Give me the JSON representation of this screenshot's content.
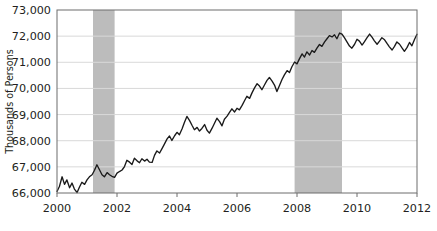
{
  "chart_data": {
    "type": "line",
    "title": "",
    "subtitle": "",
    "xlabel": "",
    "ylabel": "Thousands of Persons",
    "xlim": [
      2000.0,
      2012.0
    ],
    "ylim": [
      66000,
      73000
    ],
    "grid": "horizontal",
    "legend": "none",
    "x_ticks": [
      2000,
      2002,
      2004,
      2006,
      2008,
      2010,
      2012
    ],
    "x_tick_labels": [
      "2000",
      "2002",
      "2004",
      "2006",
      "2008",
      "2010",
      "2012"
    ],
    "y_ticks": [
      66000,
      67000,
      68000,
      69000,
      70000,
      71000,
      72000,
      73000
    ],
    "y_tick_labels": [
      "66,000",
      "67,000",
      "68,000",
      "69,000",
      "70,000",
      "71,000",
      "72,000",
      "73,000"
    ],
    "line_color": "#1a1a1a",
    "shaded_band_color": "#bcbcbc",
    "frame_color": "#6d6d6d",
    "gridline_color": "#d9d9d9",
    "annotations": [
      {
        "name": "recession-band-2001",
        "type": "vspan",
        "x_start": 2001.2,
        "x_end": 2001.92
      },
      {
        "name": "recession-band-2008",
        "type": "vspan",
        "x_start": 2007.92,
        "x_end": 2009.5
      }
    ],
    "series": [
      {
        "name": "Employment",
        "x": [
          2000.0,
          2000.08,
          2000.17,
          2000.25,
          2000.33,
          2000.42,
          2000.5,
          2000.58,
          2000.67,
          2000.75,
          2000.83,
          2000.92,
          2001.0,
          2001.08,
          2001.17,
          2001.25,
          2001.33,
          2001.42,
          2001.5,
          2001.58,
          2001.67,
          2001.75,
          2001.83,
          2001.92,
          2002.0,
          2002.08,
          2002.17,
          2002.25,
          2002.33,
          2002.42,
          2002.5,
          2002.58,
          2002.67,
          2002.75,
          2002.83,
          2002.92,
          2003.0,
          2003.08,
          2003.17,
          2003.25,
          2003.33,
          2003.42,
          2003.5,
          2003.58,
          2003.67,
          2003.75,
          2003.83,
          2003.92,
          2004.0,
          2004.08,
          2004.17,
          2004.25,
          2004.33,
          2004.42,
          2004.5,
          2004.58,
          2004.67,
          2004.75,
          2004.83,
          2004.92,
          2005.0,
          2005.08,
          2005.17,
          2005.25,
          2005.33,
          2005.42,
          2005.5,
          2005.58,
          2005.67,
          2005.75,
          2005.83,
          2005.92,
          2006.0,
          2006.08,
          2006.17,
          2006.25,
          2006.33,
          2006.42,
          2006.5,
          2006.58,
          2006.67,
          2006.75,
          2006.83,
          2006.92,
          2007.0,
          2007.08,
          2007.17,
          2007.25,
          2007.33,
          2007.42,
          2007.5,
          2007.58,
          2007.67,
          2007.75,
          2007.83,
          2007.92,
          2008.0,
          2008.08,
          2008.17,
          2008.25,
          2008.33,
          2008.42,
          2008.5,
          2008.58,
          2008.67,
          2008.75,
          2008.83,
          2008.92,
          2009.0,
          2009.08,
          2009.17,
          2009.25,
          2009.33,
          2009.42,
          2009.5,
          2009.58,
          2009.67,
          2009.75,
          2009.83,
          2009.92,
          2010.0,
          2010.08,
          2010.17,
          2010.25,
          2010.33,
          2010.42,
          2010.5,
          2010.58,
          2010.67,
          2010.75,
          2010.83,
          2010.92,
          2011.0,
          2011.08,
          2011.17,
          2011.25,
          2011.33,
          2011.42,
          2011.5,
          2011.58,
          2011.67,
          2011.75,
          2011.83,
          2011.92,
          2012.0
        ],
        "values": [
          66060,
          66250,
          66620,
          66330,
          66500,
          66200,
          66380,
          66150,
          66020,
          66230,
          66410,
          66330,
          66500,
          66620,
          66700,
          66870,
          67080,
          66880,
          66700,
          66620,
          66780,
          66700,
          66640,
          66600,
          66760,
          66820,
          66880,
          67010,
          67250,
          67180,
          67090,
          67330,
          67230,
          67160,
          67310,
          67220,
          67290,
          67180,
          67170,
          67440,
          67610,
          67530,
          67700,
          67870,
          68070,
          68180,
          68010,
          68190,
          68320,
          68230,
          68460,
          68710,
          68930,
          68770,
          68590,
          68420,
          68510,
          68370,
          68470,
          68620,
          68400,
          68290,
          68480,
          68670,
          68860,
          68730,
          68570,
          68820,
          68940,
          69080,
          69220,
          69100,
          69240,
          69180,
          69350,
          69530,
          69700,
          69620,
          69830,
          70010,
          70180,
          70090,
          69950,
          70140,
          70310,
          70420,
          70280,
          70130,
          69880,
          70120,
          70340,
          70520,
          70680,
          70610,
          70830,
          71010,
          70940,
          71130,
          71320,
          71200,
          71400,
          71280,
          71450,
          71380,
          71550,
          71680,
          71610,
          71780,
          71900,
          72020,
          71970,
          72050,
          71900,
          72120,
          72080,
          71940,
          71770,
          71620,
          71540,
          71690,
          71880,
          71810,
          71660,
          71790,
          71930,
          72080,
          71960,
          71820,
          71690,
          71810,
          71940,
          71860,
          71720,
          71590,
          71470,
          71610,
          71780,
          71690,
          71550,
          71420,
          71570,
          71760,
          71630,
          71880,
          72070
        ]
      }
    ]
  }
}
